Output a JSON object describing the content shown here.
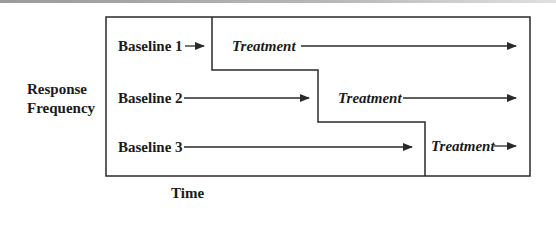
{
  "figure": {
    "type": "multiple-baseline-design",
    "y_axis_label": [
      "Response",
      "Frequency"
    ],
    "x_axis_label": "Time",
    "rows": [
      {
        "baseline_label": "Baseline 1",
        "treatment_label": "Treatment"
      },
      {
        "baseline_label": "Baseline 2",
        "treatment_label": "Treatment"
      },
      {
        "baseline_label": "Baseline 3",
        "treatment_label": "Treatment"
      }
    ],
    "colors": {
      "line": "#2a2a2a",
      "text": "#1a1a1a",
      "background": "#ffffff"
    }
  }
}
